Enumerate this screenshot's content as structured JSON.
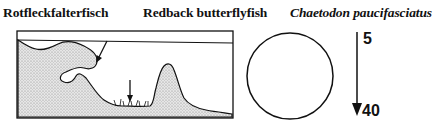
{
  "titles": {
    "german": "Rotfleckfalterfisch",
    "english": "Redback butterflyfish",
    "scientific": "Chaetodon paucifasciatus"
  },
  "habitat_diagram": {
    "description": "Reef cross-section with arrows marking habitat",
    "markers": [
      "reef-overhang-arrow",
      "sandy-bottom-arrow"
    ]
  },
  "size_circle": {
    "shape": "circle"
  },
  "depth_range": {
    "min": "5",
    "max": "40",
    "unit": "m"
  },
  "colors": {
    "ink": "#111111",
    "stipple": "#c8c8c8",
    "background": "#ffffff"
  }
}
